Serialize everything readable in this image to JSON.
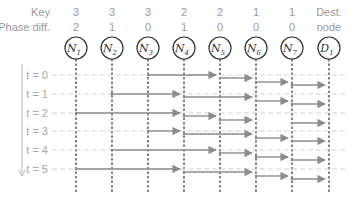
{
  "header": {
    "key_label": "Key",
    "phase_label": "Phase diff.",
    "dest_label_1": "Dest.",
    "dest_label_2": "node"
  },
  "nodes": [
    {
      "id": "N1",
      "name": "N",
      "sub": "1",
      "key": "3",
      "phase": "2",
      "x": 76
    },
    {
      "id": "N2",
      "name": "N",
      "sub": "2",
      "key": "3",
      "phase": "1",
      "x": 112
    },
    {
      "id": "N3",
      "name": "N",
      "sub": "3",
      "key": "3",
      "phase": "0",
      "x": 148
    },
    {
      "id": "N4",
      "name": "N",
      "sub": "4",
      "key": "2",
      "phase": "1",
      "x": 184
    },
    {
      "id": "N5",
      "name": "N",
      "sub": "5",
      "key": "2",
      "phase": "0",
      "x": 220
    },
    {
      "id": "N6",
      "name": "N",
      "sub": "6",
      "key": "1",
      "phase": "0",
      "x": 256
    },
    {
      "id": "N7",
      "name": "N",
      "sub": "7",
      "key": "1",
      "phase": "0",
      "x": 292
    },
    {
      "id": "D1",
      "name": "D",
      "sub": "1",
      "key": "",
      "phase": "",
      "x": 329
    }
  ],
  "time_rows": [
    {
      "label": "t = 0",
      "y": 75,
      "arrows": [
        {
          "from": 2,
          "to": 4,
          "dy": 0
        },
        {
          "from": 4,
          "to": 5,
          "dy": 3
        },
        {
          "from": 5,
          "to": 6,
          "dy": 7
        },
        {
          "from": 6,
          "to": 7,
          "dy": 10
        }
      ]
    },
    {
      "label": "t = 1",
      "y": 94,
      "arrows": [
        {
          "from": 1,
          "to": 3,
          "dy": 0
        },
        {
          "from": 3,
          "to": 5,
          "dy": 3
        },
        {
          "from": 5,
          "to": 6,
          "dy": 7
        },
        {
          "from": 6,
          "to": 7,
          "dy": 10
        }
      ]
    },
    {
      "label": "t = 2",
      "y": 113,
      "arrows": [
        {
          "from": 0,
          "to": 3,
          "dy": 0
        },
        {
          "from": 3,
          "to": 4,
          "dy": 3
        },
        {
          "from": 4,
          "to": 5,
          "dy": 7
        },
        {
          "from": 6,
          "to": 7,
          "dy": 10
        }
      ]
    },
    {
      "label": "t = 3",
      "y": 131,
      "arrows": [
        {
          "from": 2,
          "to": 3,
          "dy": 0
        },
        {
          "from": 3,
          "to": 5,
          "dy": 3
        },
        {
          "from": 5,
          "to": 6,
          "dy": 7
        },
        {
          "from": 6,
          "to": 7,
          "dy": 10
        }
      ]
    },
    {
      "label": "t = 4",
      "y": 150,
      "arrows": [
        {
          "from": 1,
          "to": 4,
          "dy": 0
        },
        {
          "from": 4,
          "to": 5,
          "dy": 3
        },
        {
          "from": 5,
          "to": 6,
          "dy": 7
        },
        {
          "from": 6,
          "to": 7,
          "dy": 10
        }
      ]
    },
    {
      "label": "t = 5",
      "y": 169,
      "arrows": [
        {
          "from": 0,
          "to": 3,
          "dy": 0
        },
        {
          "from": 3,
          "to": 5,
          "dy": 3
        },
        {
          "from": 5,
          "to": 6,
          "dy": 7
        },
        {
          "from": 6,
          "to": 7,
          "dy": 10
        }
      ]
    }
  ],
  "colors": {
    "arrow": "#8c8c8c",
    "baseline": "#cfcfcf",
    "vline": "#333333",
    "text": "#9a9a9a",
    "circle": "#333333"
  }
}
